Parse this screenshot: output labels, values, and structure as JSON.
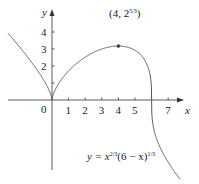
{
  "chart_data": {
    "type": "line",
    "title": "",
    "equation": "y = x^{2/3}(6 - x)^{1/3}",
    "equation_label": "y = x2/3(6 − x)1/3",
    "xlabel": "x",
    "ylabel": "y",
    "x_ticks": [
      1,
      2,
      3,
      4,
      5,
      7
    ],
    "y_ticks": [
      1,
      2,
      3,
      4
    ],
    "origin_label": "0",
    "xlim": [
      -3,
      8
    ],
    "ylim": [
      -4.5,
      5.5
    ],
    "grid": false,
    "annotation": {
      "label": "(4, 2^{5/3})",
      "x": 4,
      "y": 3.17
    },
    "x": [
      -3,
      -2,
      -1,
      -0.5,
      0,
      0.5,
      1,
      2,
      3,
      4,
      5,
      5.5,
      5.9,
      6,
      6.1,
      6.5,
      7,
      7.5
    ],
    "values": [
      4.33,
      3.17,
      1.91,
      1.26,
      0,
      1.04,
      1.71,
      2.52,
      3.0,
      3.17,
      2.92,
      2.55,
      1.69,
      0,
      -1.69,
      -2.35,
      -3.66,
      -4.5
    ]
  },
  "labels": {
    "x_axis": "x",
    "y_axis": "y",
    "origin": "0",
    "point": "(4, 2",
    "point_exp": "5/3",
    "point_close": ")",
    "eq_y": "y = x",
    "eq_exp1": "2/3",
    "eq_mid": "(6 − x)",
    "eq_exp2": "1/3"
  },
  "colors": {
    "curve": "#555555",
    "axis": "#333333"
  }
}
